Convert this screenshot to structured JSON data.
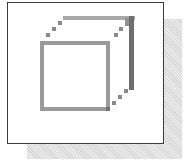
{
  "icon": {
    "name": "cube-icon",
    "style": "pixelated wireframe cube",
    "colors": {
      "front_face": "#9a9a9a",
      "back_face_top": "#a8a8a8",
      "back_face_right": "#707070",
      "diagonals": "#8a8a8a",
      "panel_border": "#3a3a3a",
      "shadow": "#d9d9d9"
    }
  }
}
